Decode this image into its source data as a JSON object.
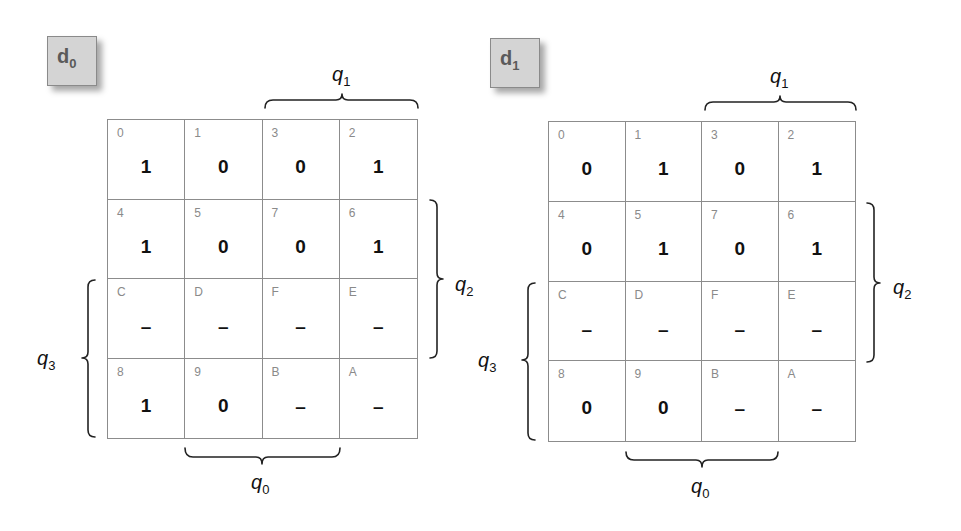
{
  "maps": [
    {
      "id": "d0",
      "label": {
        "main": "d",
        "sub": "0"
      },
      "box": {
        "left": 47,
        "top": 36
      },
      "grid": {
        "left": 107,
        "top": 119,
        "width": 311,
        "height": 320
      },
      "cells": [
        [
          {
            "index": "0",
            "value": "1"
          },
          {
            "index": "1",
            "value": "0"
          },
          {
            "index": "3",
            "value": "0"
          },
          {
            "index": "2",
            "value": "1"
          }
        ],
        [
          {
            "index": "4",
            "value": "1"
          },
          {
            "index": "5",
            "value": "0"
          },
          {
            "index": "7",
            "value": "0"
          },
          {
            "index": "6",
            "value": "1"
          }
        ],
        [
          {
            "index": "C",
            "value": "–"
          },
          {
            "index": "D",
            "value": "–"
          },
          {
            "index": "F",
            "value": "–"
          },
          {
            "index": "E",
            "value": "–"
          }
        ],
        [
          {
            "index": "8",
            "value": "1"
          },
          {
            "index": "9",
            "value": "0"
          },
          {
            "index": "B",
            "value": "–"
          },
          {
            "index": "A",
            "value": "–"
          }
        ]
      ],
      "variables": {
        "q1": {
          "main": "q",
          "sub": "1",
          "left": 332,
          "top": 64
        },
        "q2": {
          "main": "q",
          "sub": "2",
          "left": 455,
          "top": 274
        },
        "q3": {
          "main": "q",
          "sub": "3",
          "left": 37,
          "top": 348
        },
        "q0": {
          "main": "q",
          "sub": "0",
          "left": 251,
          "top": 472
        }
      }
    },
    {
      "id": "d1",
      "label": {
        "main": "d",
        "sub": "1"
      },
      "box": {
        "left": 490,
        "top": 38
      },
      "grid": {
        "left": 548,
        "top": 121,
        "width": 308,
        "height": 321
      },
      "cells": [
        [
          {
            "index": "0",
            "value": "0"
          },
          {
            "index": "1",
            "value": "1"
          },
          {
            "index": "3",
            "value": "0"
          },
          {
            "index": "2",
            "value": "1"
          }
        ],
        [
          {
            "index": "4",
            "value": "0"
          },
          {
            "index": "5",
            "value": "1"
          },
          {
            "index": "7",
            "value": "0"
          },
          {
            "index": "6",
            "value": "1"
          }
        ],
        [
          {
            "index": "C",
            "value": "–"
          },
          {
            "index": "D",
            "value": "–"
          },
          {
            "index": "F",
            "value": "–"
          },
          {
            "index": "E",
            "value": "–"
          }
        ],
        [
          {
            "index": "8",
            "value": "0"
          },
          {
            "index": "9",
            "value": "0"
          },
          {
            "index": "B",
            "value": "–"
          },
          {
            "index": "A",
            "value": "–"
          }
        ]
      ],
      "variables": {
        "q1": {
          "main": "q",
          "sub": "1",
          "left": 770,
          "top": 66
        },
        "q2": {
          "main": "q",
          "sub": "2",
          "left": 893,
          "top": 277
        },
        "q3": {
          "main": "q",
          "sub": "3",
          "left": 478,
          "top": 350
        },
        "q0": {
          "main": "q",
          "sub": "0",
          "left": 691,
          "top": 476
        }
      }
    }
  ]
}
